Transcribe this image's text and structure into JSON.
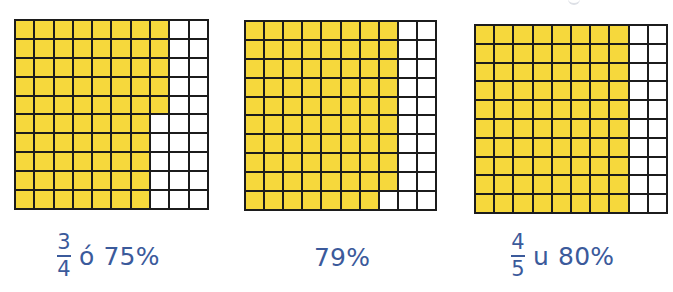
{
  "colors": {
    "filled": "#f6d83c",
    "empty": "#ffffff",
    "grid_line": "#1c1c1c",
    "label_text": "#3b5a9b"
  },
  "panels": [
    {
      "id": "grid-75",
      "rows": 10,
      "cols": 10,
      "filled_per_row": [
        8,
        8,
        8,
        8,
        8,
        7,
        7,
        7,
        7,
        7
      ],
      "filled_total": 75,
      "label": {
        "fraction": {
          "numerator": "3",
          "denominator": "4"
        },
        "connector": "ó",
        "percent": "75%"
      }
    },
    {
      "id": "grid-79",
      "rows": 10,
      "cols": 10,
      "filled_per_row": [
        8,
        8,
        8,
        8,
        8,
        8,
        8,
        8,
        8,
        7
      ],
      "filled_total": 79,
      "label": {
        "percent": "79%"
      }
    },
    {
      "id": "grid-80",
      "rows": 10,
      "cols": 10,
      "filled_per_row": [
        8,
        8,
        8,
        8,
        8,
        8,
        8,
        8,
        8,
        8
      ],
      "filled_total": 80,
      "label": {
        "fraction": {
          "numerator": "4",
          "denominator": "5"
        },
        "connector": "u",
        "percent": "80%"
      }
    }
  ]
}
